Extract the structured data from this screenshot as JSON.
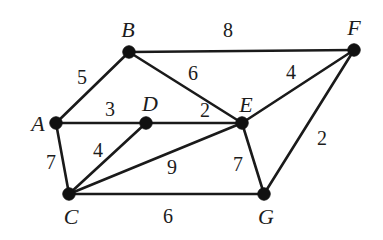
{
  "figure": {
    "kind": "weighted-undirected-graph",
    "background_color": "#ffffff",
    "stroke_color": "#1a1a1a",
    "node_color": "#111111",
    "text_color": "#1c1c1c",
    "width": 383,
    "height": 240
  },
  "chart_data": {
    "type": "diagram",
    "diagram_type": "weighted undirected graph",
    "title": "",
    "xlabel": "",
    "ylabel": "",
    "grid": false,
    "legend": null,
    "node_count": 7,
    "edge_count": 12,
    "nodes": [
      {
        "id": "A",
        "label": "A",
        "x": 56,
        "y": 123,
        "label_x": 38,
        "label_y": 124
      },
      {
        "id": "B",
        "label": "B",
        "x": 129,
        "y": 52,
        "label_x": 128,
        "label_y": 30
      },
      {
        "id": "C",
        "label": "C",
        "x": 69,
        "y": 194,
        "label_x": 71,
        "label_y": 217
      },
      {
        "id": "D",
        "label": "D",
        "x": 146,
        "y": 123,
        "label_x": 150,
        "label_y": 104
      },
      {
        "id": "E",
        "label": "E",
        "x": 242,
        "y": 123,
        "label_x": 246,
        "label_y": 105
      },
      {
        "id": "F",
        "label": "F",
        "x": 354,
        "y": 50,
        "label_x": 354,
        "label_y": 28
      },
      {
        "id": "G",
        "label": "G",
        "x": 264,
        "y": 194,
        "label_x": 266,
        "label_y": 217
      }
    ],
    "edges": [
      {
        "source": "A",
        "target": "B",
        "weight": 5,
        "label": "5",
        "label_x": 82,
        "label_y": 77
      },
      {
        "source": "A",
        "target": "D",
        "weight": 3,
        "label": "3",
        "label_x": 110,
        "label_y": 109
      },
      {
        "source": "A",
        "target": "C",
        "weight": 7,
        "label": "7",
        "label_x": 51,
        "label_y": 162
      },
      {
        "source": "B",
        "target": "F",
        "weight": 8,
        "label": "8",
        "label_x": 228,
        "label_y": 30
      },
      {
        "source": "B",
        "target": "E",
        "weight": 6,
        "label": "6",
        "label_x": 193,
        "label_y": 73
      },
      {
        "source": "D",
        "target": "E",
        "weight": 2,
        "label": "2",
        "label_x": 205,
        "label_y": 110
      },
      {
        "source": "D",
        "target": "C",
        "weight": 4,
        "label": "4",
        "label_x": 98,
        "label_y": 150
      },
      {
        "source": "C",
        "target": "E",
        "weight": 9,
        "label": "9",
        "label_x": 172,
        "label_y": 167
      },
      {
        "source": "C",
        "target": "G",
        "weight": 6,
        "label": "6",
        "label_x": 168,
        "label_y": 216
      },
      {
        "source": "E",
        "target": "F",
        "weight": 4,
        "label": "4",
        "label_x": 291,
        "label_y": 72
      },
      {
        "source": "E",
        "target": "G",
        "weight": 7,
        "label": "7",
        "label_x": 238,
        "label_y": 164
      },
      {
        "source": "F",
        "target": "G",
        "weight": 2,
        "label": "2",
        "label_x": 322,
        "label_y": 138
      }
    ],
    "weights": [
      5,
      3,
      7,
      8,
      6,
      2,
      4,
      9,
      6,
      4,
      7,
      2
    ],
    "node_labels": [
      "A",
      "B",
      "C",
      "D",
      "E",
      "F",
      "G"
    ],
    "adjacency": {
      "A": [
        "B",
        "D",
        "C"
      ],
      "B": [
        "A",
        "F",
        "E"
      ],
      "C": [
        "A",
        "D",
        "E",
        "G"
      ],
      "D": [
        "A",
        "E",
        "C"
      ],
      "E": [
        "B",
        "D",
        "C",
        "F",
        "G"
      ],
      "F": [
        "B",
        "E",
        "G"
      ],
      "G": [
        "C",
        "E",
        "F"
      ]
    }
  }
}
